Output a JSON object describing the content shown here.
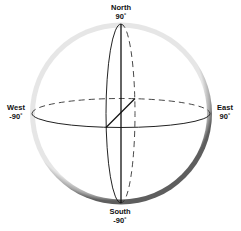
{
  "diagram": {
    "type": "sphere-coordinate-diagram",
    "labels": {
      "north": {
        "name": "North",
        "value": "90˚"
      },
      "south": {
        "name": "South",
        "value": "-90˚"
      },
      "west": {
        "name": "West",
        "value": "-90˚"
      },
      "east": {
        "name": "East",
        "value": "90˚"
      }
    },
    "colors": {
      "line": "#222222",
      "rim_light": "#d8d8d8",
      "rim_dark": "#6a6a6a",
      "background": "#ffffff"
    }
  }
}
